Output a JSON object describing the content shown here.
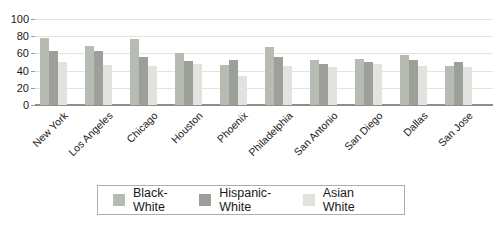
{
  "chart_data": {
    "type": "bar",
    "title": "",
    "categories": [
      "New York",
      "Los Angeles",
      "Chicago",
      "Houston",
      "Phoenix",
      "Philadelphia",
      "San Antonio",
      "San Diego",
      "Dallas",
      "San Jose"
    ],
    "series": [
      {
        "name": "Black-White",
        "color": "#b7bcb3",
        "values": [
          78,
          69,
          77,
          61,
          47,
          68,
          52,
          54,
          58,
          45
        ]
      },
      {
        "name": "Hispanic-White",
        "color": "#9d9f9a",
        "values": [
          63,
          63,
          56,
          51,
          52,
          56,
          48,
          50,
          52,
          50
        ]
      },
      {
        "name": "Asian White",
        "color": "#e2e3de",
        "values": [
          50,
          47,
          45,
          48,
          34,
          45,
          44,
          48,
          45,
          44
        ]
      }
    ],
    "ylim": [
      0,
      100
    ],
    "yticks": [
      0,
      20,
      40,
      60,
      80,
      100
    ],
    "grid": true,
    "legend_position": "bottom",
    "colors": {
      "gridline": "#e3e3e0",
      "axis_line": "#8e8e8b",
      "tick_mark": "#9a9a97",
      "text": "#1a1a1a",
      "legend_border": "#aeaeab",
      "background": "#ffffff"
    }
  }
}
